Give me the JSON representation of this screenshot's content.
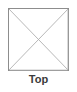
{
  "figure": {
    "kind": "orthographic-view-thumbnail",
    "caption": "Top",
    "shape": {
      "name": "square-face",
      "sides": 4,
      "diagonals": 2
    },
    "colors": {
      "background": "#ffffff",
      "outline": "#8a8a8a",
      "outline_shadow": "#b7b7b7",
      "diagonal": "#b0b0b0",
      "caption_text": "#3b3b3b"
    },
    "geometry": {
      "x": 8,
      "y": 8,
      "width": 61,
      "height": 63,
      "corners": [
        {
          "label": "top-left",
          "x": 0,
          "y": 0
        },
        {
          "label": "top-right",
          "x": 61,
          "y": 0
        },
        {
          "label": "bottom-right",
          "x": 61,
          "y": 63
        },
        {
          "label": "bottom-left",
          "x": 0,
          "y": 63
        }
      ],
      "diagonal_segments": [
        {
          "label": "tl-br",
          "x1": 0,
          "y1": 0,
          "x2": 61,
          "y2": 63
        },
        {
          "label": "tr-bl",
          "x1": 61,
          "y1": 0,
          "x2": 0,
          "y2": 63
        }
      ]
    }
  }
}
